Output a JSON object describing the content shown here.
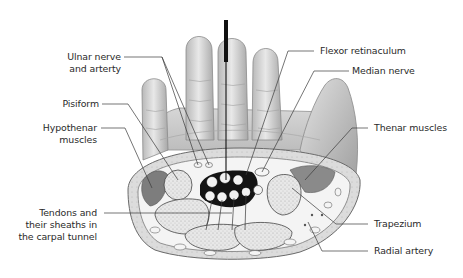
{
  "figure": {
    "needle": {
      "color": "#111111"
    },
    "colors": {
      "skin": "#d9d9d9",
      "skin_shadow": "#9a9a9a",
      "bone_fill": "#e6e6e6",
      "hypothenar_muscle": "#7a7a7a",
      "thenar_muscle": "#8a8a8a",
      "tunnel_dark": "#1a1a1a",
      "leader_line": "#3a3a3a"
    }
  },
  "labels": {
    "left": [
      {
        "id": "ulnar",
        "lines": [
          "Ulnar nerve",
          "and arterty"
        ]
      },
      {
        "id": "pisiform",
        "lines": [
          "Pisiform"
        ]
      },
      {
        "id": "hypothenar",
        "lines": [
          "Hypothenar",
          "muscles"
        ]
      },
      {
        "id": "tendons",
        "lines": [
          "Tendons and",
          "their sheaths in",
          "the carpal tunnel"
        ]
      }
    ],
    "right": [
      {
        "id": "flexor",
        "lines": [
          "Flexor retinaculum"
        ]
      },
      {
        "id": "median",
        "lines": [
          "Median nerve"
        ]
      },
      {
        "id": "thenar",
        "lines": [
          "Thenar muscles"
        ]
      },
      {
        "id": "trapezium",
        "lines": [
          "Trapezium"
        ]
      },
      {
        "id": "radial",
        "lines": [
          "Radial artery"
        ]
      }
    ]
  }
}
